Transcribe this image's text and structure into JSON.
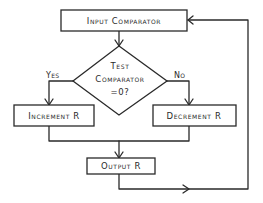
{
  "diagram": {
    "type": "flowchart",
    "nodes": {
      "input": {
        "label": "Input Comparator",
        "shape": "rectangle"
      },
      "test": {
        "label_lines": [
          "Test",
          "Comparator",
          "=0?"
        ],
        "shape": "diamond"
      },
      "increment": {
        "label": "Increment R",
        "shape": "rectangle"
      },
      "decrement": {
        "label": "Decrement R",
        "shape": "rectangle"
      },
      "output": {
        "label": "Output R",
        "shape": "rectangle"
      }
    },
    "edges": {
      "yes": {
        "label": "Yes",
        "from": "test",
        "to": "increment"
      },
      "no": {
        "label": "No",
        "from": "test",
        "to": "decrement"
      },
      "input_to_test": {
        "from": "input",
        "to": "test"
      },
      "increment_to_output": {
        "from": "increment",
        "to": "output"
      },
      "decrement_to_output": {
        "from": "decrement",
        "to": "output"
      },
      "output_loop": {
        "from": "output",
        "to": "input"
      }
    },
    "colors": {
      "ink": "#2a2a2a",
      "background": "#ffffff"
    }
  }
}
